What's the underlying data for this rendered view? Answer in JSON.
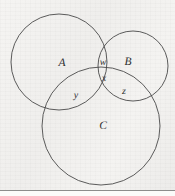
{
  "figure": {
    "type": "venn-diagram",
    "background_color": "#f2f2f0",
    "stroke_color": "#4a4a4a",
    "text_color": "#2e2e2e",
    "width": 175,
    "height": 196
  },
  "circles": [
    {
      "name": "circle-a",
      "label": "A",
      "cx": 59,
      "cy": 62,
      "r": 48
    },
    {
      "name": "circle-b",
      "label": "B",
      "cx": 133,
      "cy": 66,
      "r": 35
    },
    {
      "name": "circle-c",
      "label": "C",
      "cx": 101,
      "cy": 126,
      "r": 59
    }
  ],
  "labels": {
    "set_a": "A",
    "set_b": "B",
    "set_c": "C",
    "region_w": "w",
    "region_x": "x",
    "region_y": "y",
    "region_z": "z"
  },
  "label_positions": {
    "set_a": {
      "x": 62,
      "y": 63
    },
    "set_b": {
      "x": 128,
      "y": 62
    },
    "set_c": {
      "x": 103,
      "y": 126
    },
    "region_w": {
      "x": 103,
      "y": 62
    },
    "region_x": {
      "x": 104,
      "y": 78
    },
    "region_y": {
      "x": 76,
      "y": 95
    },
    "region_z": {
      "x": 124,
      "y": 91
    }
  },
  "rule": {
    "name": "bottom-rule",
    "y": 190,
    "color": "#8c8c8c"
  }
}
